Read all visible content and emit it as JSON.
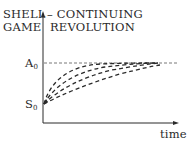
{
  "diagram": {
    "left_label_line1": "SHELL",
    "left_label_line2": "GAME",
    "right_label_line1": "– CONTINUING",
    "right_label_line2": "REVOLUTION",
    "y_tick_top": "A",
    "y_tick_top_sub": "0",
    "y_tick_bottom": "S",
    "y_tick_bottom_sub": "0",
    "x_axis_label": "time",
    "curve_count": 4,
    "line_color": "#2a2a2a",
    "background": "#ffffff"
  }
}
